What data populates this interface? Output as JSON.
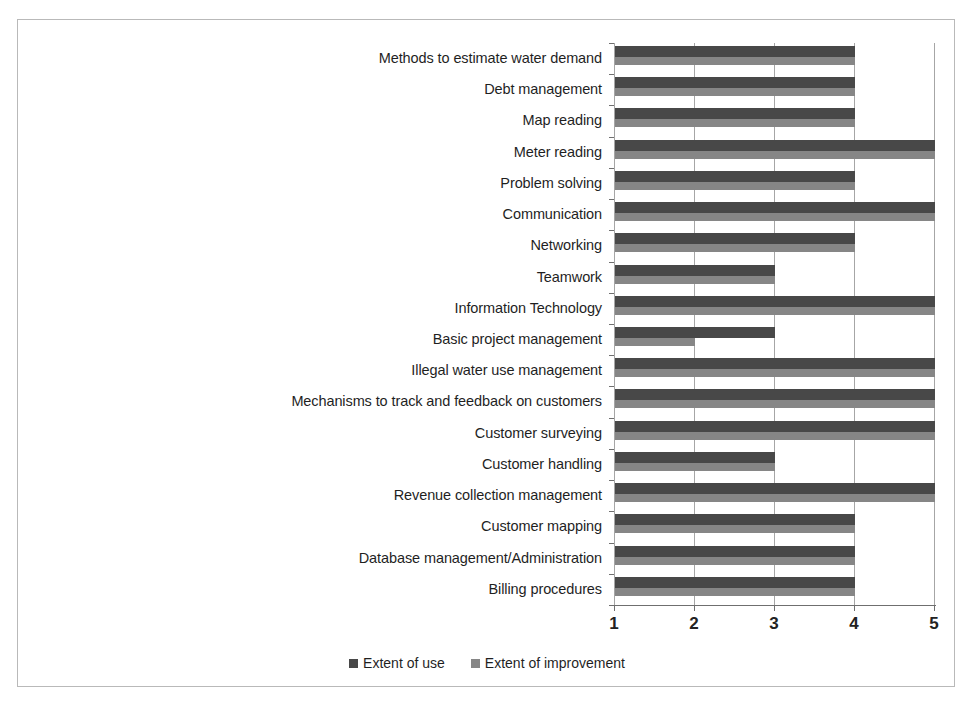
{
  "chart_data": {
    "type": "bar",
    "orientation": "horizontal",
    "title": "",
    "subtitle": "",
    "xlabel": "",
    "ylabel": "",
    "xlim": [
      1,
      5
    ],
    "xticks": [
      "1",
      "2",
      "3",
      "4",
      "5"
    ],
    "grid": true,
    "legend_position": "bottom",
    "categories": [
      "Methods to estimate water demand",
      "Debt management",
      "Map reading",
      "Meter reading",
      "Problem solving",
      "Communication",
      "Networking",
      "Teamwork",
      "Information Technology",
      "Basic project management",
      "Illegal water use management",
      "Mechanisms to track and feedback on customers",
      "Customer surveying",
      "Customer handling",
      "Revenue collection management",
      "Customer mapping",
      "Database management/Administration",
      "Billing procedures"
    ],
    "series": [
      {
        "name": "Extent of use",
        "color": "#484848",
        "values": [
          4,
          4,
          4,
          5,
          4,
          5,
          4,
          3,
          5,
          3,
          5,
          5,
          5,
          3,
          5,
          4,
          4,
          4
        ]
      },
      {
        "name": "Extent of improvement",
        "color": "#868686",
        "values": [
          4,
          4,
          4,
          5,
          4,
          5,
          4,
          3,
          5,
          2,
          5,
          5,
          5,
          3,
          5,
          4,
          4,
          4
        ]
      }
    ]
  },
  "legend": {
    "entries": [
      {
        "label": "Extent of use",
        "color": "#484848"
      },
      {
        "label": "Extent of improvement",
        "color": "#868686"
      }
    ]
  }
}
